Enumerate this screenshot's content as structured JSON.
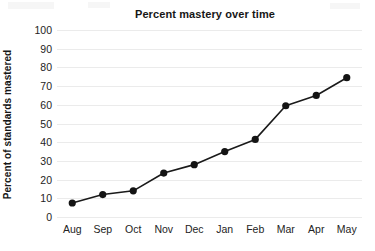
{
  "chart_data": {
    "type": "line",
    "title": "Percent mastery over time",
    "xlabel": "",
    "ylabel": "Percent of standards mastered",
    "categories": [
      "Aug",
      "Sep",
      "Oct",
      "Nov",
      "Dec",
      "Jan",
      "Feb",
      "Mar",
      "Apr",
      "May"
    ],
    "values": [
      7.5,
      12,
      14,
      23.5,
      28,
      35,
      41.5,
      59.5,
      65,
      74.5
    ],
    "ylim": [
      0,
      100
    ],
    "yticks": [
      0,
      10,
      20,
      30,
      40,
      50,
      60,
      70,
      80,
      90,
      100
    ],
    "ytick_labels": [
      "0",
      "10",
      "20",
      "30",
      "40",
      "50",
      "60",
      "70",
      "80",
      "90",
      "100"
    ],
    "grid": "horizontal",
    "legend": "none",
    "marker": "filled-circle",
    "series_color": "#1a1a1a",
    "gridline_color": "#ebebeb",
    "background_color": "#ffffff"
  }
}
